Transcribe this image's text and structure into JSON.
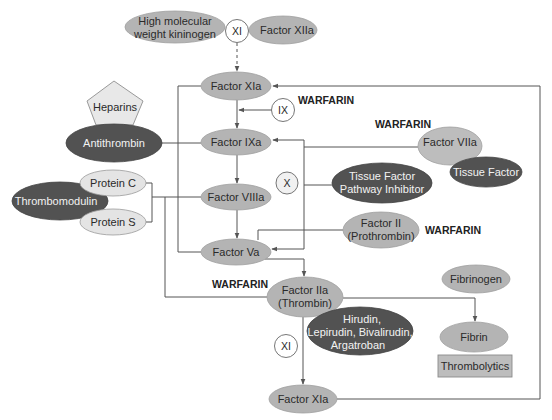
{
  "figure": {
    "type": "coagulation-cascade-diagram",
    "colors": {
      "factor_fill": "#b4b4b4",
      "inhibitor_fill": "#525252",
      "cofactor_fill": "#e4e4e4",
      "line": "#555555",
      "drug_label": "#222222"
    }
  },
  "nodes": {
    "hmwk": {
      "lines": [
        "High molecular",
        "weight kininogen"
      ]
    },
    "xi_top": {
      "label": "XI"
    },
    "factor_xiia": {
      "label": "Factor XIIa"
    },
    "factor_xia_top": {
      "label": "Factor XIa"
    },
    "ix": {
      "label": "IX"
    },
    "heparins": {
      "label": "Heparins"
    },
    "antithrombin": {
      "label": "Antithrombin"
    },
    "factor_ixa": {
      "label": "Factor IXa"
    },
    "factor_viia": {
      "label": "Factor VIIa"
    },
    "tissue_factor": {
      "label": "Tissue Factor"
    },
    "protein_c": {
      "label": "Protein C"
    },
    "thrombomodulin": {
      "label": "Thrombomodulin"
    },
    "protein_s": {
      "label": "Protein S"
    },
    "factor_viiia": {
      "label": "Factor VIIIa"
    },
    "x": {
      "label": "X"
    },
    "tfpi": {
      "lines": [
        "Tissue Factor",
        "Pathway Inhibitor"
      ]
    },
    "factor_ii": {
      "lines": [
        "Factor II",
        "(Prothrombin)"
      ]
    },
    "factor_va": {
      "label": "Factor Va"
    },
    "factor_iia": {
      "lines": [
        "Factor IIa",
        "(Thrombin)"
      ]
    },
    "direct_thrombin_inhibitors": {
      "lines": [
        "Hirudin,",
        "Lepirudin, Bivalirudin,",
        "Argatroban"
      ]
    },
    "fibrinogen": {
      "label": "Fibrinogen"
    },
    "fibrin": {
      "label": "Fibrin"
    },
    "thrombolytics": {
      "label": "Thrombolytics"
    },
    "xi_bottom": {
      "label": "XI"
    },
    "factor_xia_bottom": {
      "label": "Factor XIa"
    }
  },
  "drug_labels": {
    "warfarin_ix": "WARFARIN",
    "warfarin_viia": "WARFARIN",
    "warfarin_ii": "WARFARIN",
    "warfarin_iia": "WARFARIN"
  }
}
